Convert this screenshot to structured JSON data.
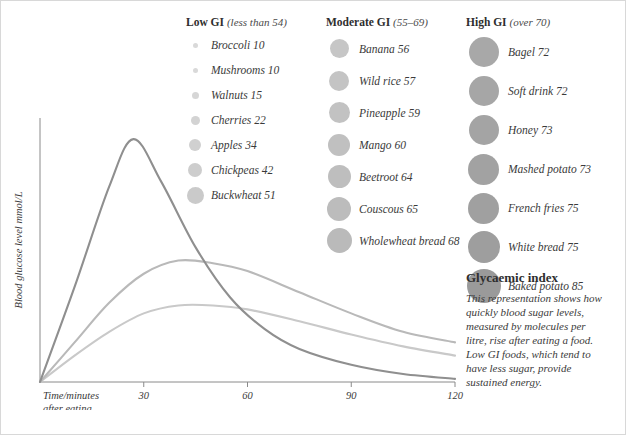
{
  "chart_data": {
    "type": "line",
    "title": "Glycaemic index",
    "xlabel": "Time/minutes after eating",
    "ylabel": "Blood glucose level mmol/L",
    "xticks": [
      0,
      30,
      60,
      90,
      120
    ],
    "xtick_labels": [
      "",
      "30",
      "60",
      "90",
      "120"
    ],
    "xlim": [
      0,
      120
    ],
    "ylim": [
      0,
      10
    ],
    "grid": false,
    "legend_position": "none",
    "series": [
      {
        "name": "High GI",
        "color": "#8f8f8f",
        "x": [
          0,
          10,
          20,
          27,
          35,
          45,
          55,
          65,
          75,
          90,
          105,
          120
        ],
        "y": [
          0,
          3.6,
          7.4,
          9.2,
          7.6,
          5.1,
          3.2,
          2.0,
          1.25,
          0.65,
          0.3,
          0.12
        ]
      },
      {
        "name": "Moderate GI",
        "color": "#b9b9b9",
        "x": [
          0,
          10,
          20,
          30,
          40,
          50,
          60,
          75,
          90,
          105,
          120
        ],
        "y": [
          0,
          1.5,
          3.0,
          4.1,
          4.6,
          4.5,
          4.2,
          3.4,
          2.6,
          1.9,
          1.5
        ]
      },
      {
        "name": "Low GI",
        "color": "#c9c9c9",
        "x": [
          0,
          10,
          20,
          30,
          40,
          50,
          60,
          75,
          90,
          105,
          120
        ],
        "y": [
          0,
          1.0,
          1.9,
          2.6,
          2.9,
          2.9,
          2.75,
          2.3,
          1.8,
          1.35,
          1.0
        ]
      }
    ]
  },
  "legends": {
    "low": {
      "title": "Low GI",
      "subtitle": "(less than 54)",
      "items": [
        {
          "label": "Broccoli 10",
          "value": 10,
          "dot": 5,
          "color": "#d9d9d9"
        },
        {
          "label": "Mushrooms 10",
          "value": 10,
          "dot": 5,
          "color": "#d9d9d9"
        },
        {
          "label": "Walnuts 15",
          "value": 15,
          "dot": 7,
          "color": "#d6d6d6"
        },
        {
          "label": "Cherries 22",
          "value": 22,
          "dot": 9,
          "color": "#d3d3d3"
        },
        {
          "label": "Apples 34",
          "value": 34,
          "dot": 12,
          "color": "#d0d0d0"
        },
        {
          "label": "Chickpeas 42",
          "value": 42,
          "dot": 14,
          "color": "#cdcdcd"
        },
        {
          "label": "Buckwheat 51",
          "value": 51,
          "dot": 17,
          "color": "#cacaca"
        }
      ]
    },
    "moderate": {
      "title": "Moderate GI",
      "subtitle": "(55–69)",
      "items": [
        {
          "label": "Banana 56",
          "value": 56,
          "dot": 19,
          "color": "#c6c6c6"
        },
        {
          "label": "Wild rice 57",
          "value": 57,
          "dot": 20,
          "color": "#c4c4c4"
        },
        {
          "label": "Pineapple 59",
          "value": 59,
          "dot": 21,
          "color": "#c2c2c2"
        },
        {
          "label": "Mango 60",
          "value": 60,
          "dot": 22,
          "color": "#c0c0c0"
        },
        {
          "label": "Beetroot 64",
          "value": 64,
          "dot": 23,
          "color": "#bebebe"
        },
        {
          "label": "Couscous 65",
          "value": 65,
          "dot": 24,
          "color": "#bcbcbc"
        },
        {
          "label": "Wholewheat bread 68",
          "value": 68,
          "dot": 25,
          "color": "#bababa"
        }
      ]
    },
    "high": {
      "title": "High GI",
      "subtitle": "(over 70)",
      "items": [
        {
          "label": "Bagel 72",
          "value": 72,
          "dot": 30,
          "color": "#a8a8a8"
        },
        {
          "label": "Soft drink 72",
          "value": 72,
          "dot": 30,
          "color": "#a6a6a6"
        },
        {
          "label": "Honey 73",
          "value": 73,
          "dot": 30,
          "color": "#a4a4a4"
        },
        {
          "label": "Mashed potato 73",
          "value": 73,
          "dot": 31,
          "color": "#a2a2a2"
        },
        {
          "label": "French fries 75",
          "value": 75,
          "dot": 31,
          "color": "#a0a0a0"
        },
        {
          "label": "White bread 75",
          "value": 75,
          "dot": 32,
          "color": "#9e9e9e"
        },
        {
          "label": "Baked potato 85",
          "value": 85,
          "dot": 34,
          "color": "#9a9a9a"
        }
      ]
    }
  },
  "note": {
    "title": "Glycaemic index",
    "body": "This representation shows how quickly blood sugar levels, measured by molecules per litre, rise after eating a food. Low GI foods, which tend to have less sugar, provide sustained energy."
  },
  "axis": {
    "y_label": "Blood glucose level mmol/L",
    "x_label_line1": "Time/minutes",
    "x_label_line2": "after eating",
    "ticks": [
      "30",
      "60",
      "90",
      "120"
    ]
  }
}
